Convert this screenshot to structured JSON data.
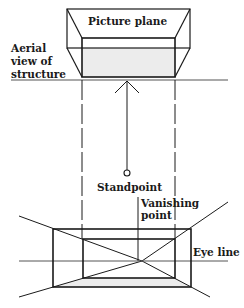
{
  "diagram": {
    "labels": {
      "picture_plane": "Picture plane",
      "aerial_line1": "Aerial",
      "aerial_line2": "view of",
      "aerial_line3": "structure",
      "standpoint": "Standpoint",
      "vanishing_line1": "Vanishing",
      "vanishing_line2": "point",
      "eye_line": "Eye line"
    },
    "colors": {
      "line": "#1a1a1a",
      "shade": "#ececec",
      "background": "#ffffff"
    }
  }
}
